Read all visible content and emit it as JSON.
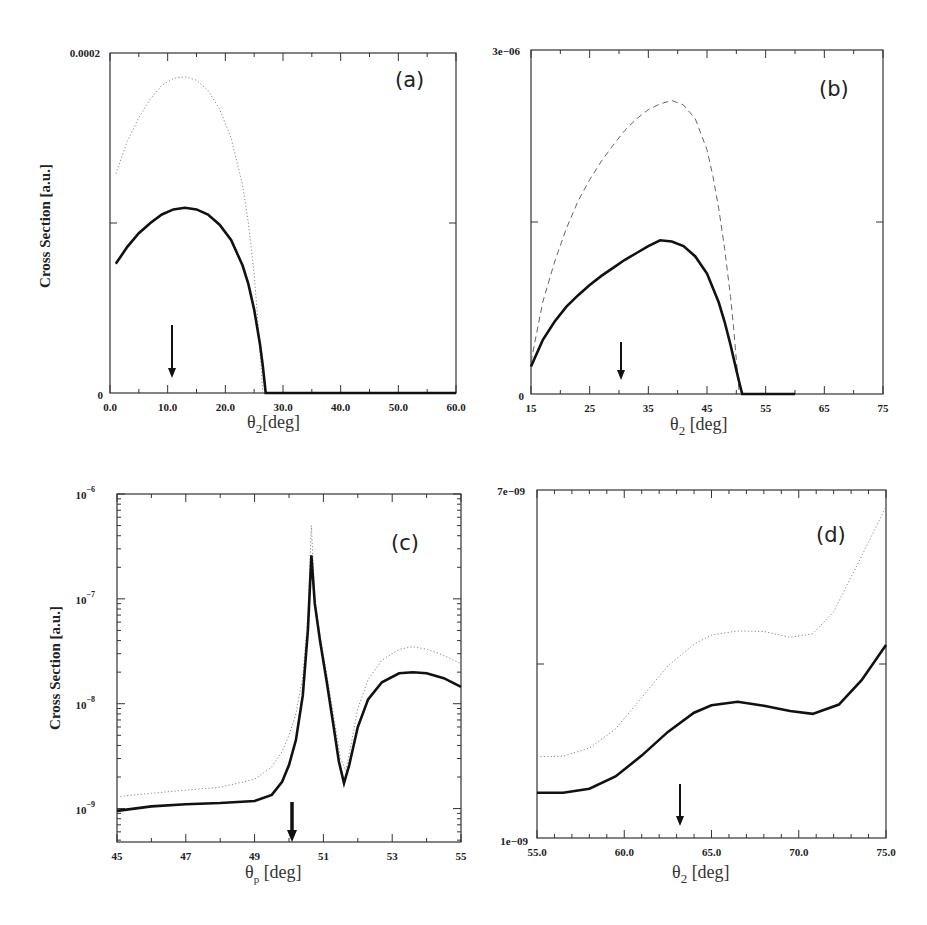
{
  "figure": {
    "shared_ylabel": "Cross Section [a.u.]"
  },
  "chart_data": [
    {
      "panel": "(a)",
      "type": "line",
      "title": "(a)",
      "xlabel": "θ2[deg]",
      "ylabel": "Cross Section [a.u.]",
      "xlim": [
        0,
        60
      ],
      "ylim": [
        0,
        0.0002
      ],
      "yscale": "linear",
      "x_ticks": [
        "0.0",
        "10.0",
        "20.0",
        "30.0",
        "40.0",
        "50.0",
        "60.0"
      ],
      "y_tick_labels": [
        "0",
        "0.0002"
      ],
      "grid": false,
      "arrow_at_x": 10.5,
      "series": [
        {
          "name": "solid",
          "style": "solid",
          "x": [
            1,
            3,
            5,
            7,
            9,
            11,
            13,
            15,
            17,
            19,
            21,
            23,
            24,
            25,
            26,
            26.5,
            27,
            30,
            40,
            50,
            60
          ],
          "y": [
            7.6e-05,
            8.6e-05,
            9.4e-05,
            0.0001,
            0.000105,
            0.000108,
            0.000109,
            0.000108,
            0.000105,
            9.9e-05,
            9e-05,
            7.5e-05,
            6.4e-05,
            4.9e-05,
            2.9e-05,
            1.6e-05,
            0,
            0,
            0,
            0,
            0
          ]
        },
        {
          "name": "dotted",
          "style": "dotted",
          "x": [
            1,
            3,
            5,
            7,
            9,
            11,
            13,
            15,
            17,
            19,
            21,
            23,
            24,
            25,
            25.8,
            26.5
          ],
          "y": [
            0.000129,
            0.000148,
            0.000162,
            0.000173,
            0.000181,
            0.000185,
            0.000186,
            0.000184,
            0.000178,
            0.000167,
            0.00015,
            0.000122,
            0.0001,
            7e-05,
            3.5e-05,
            0
          ]
        }
      ]
    },
    {
      "panel": "(b)",
      "type": "line",
      "title": "(b)",
      "xlabel": "θ2 [deg]",
      "ylabel": "",
      "xlim": [
        15,
        75
      ],
      "ylim": [
        0,
        3e-06
      ],
      "yscale": "linear",
      "x_ticks": [
        "15",
        "25",
        "35",
        "45",
        "55",
        "65",
        "75"
      ],
      "y_tick_labels": [
        "0",
        "3e−06"
      ],
      "grid": false,
      "arrow_at_x": 30,
      "series": [
        {
          "name": "solid",
          "style": "solid",
          "x": [
            15,
            17,
            19,
            21,
            23,
            25,
            27,
            29,
            31,
            33,
            35,
            37,
            39,
            41,
            43,
            45,
            47,
            48,
            49,
            50,
            50.5,
            51,
            55,
            60
          ],
          "y": [
            2.4e-07,
            4.7e-07,
            6.3e-07,
            7.6e-07,
            8.6e-07,
            9.5e-07,
            1.03e-06,
            1.1e-06,
            1.17e-06,
            1.23e-06,
            1.29e-06,
            1.34e-06,
            1.33e-06,
            1.29e-06,
            1.2e-06,
            1.05e-06,
            8e-07,
            6.3e-07,
            4.3e-07,
            2.1e-07,
            1e-07,
            0,
            0,
            0
          ]
        },
        {
          "name": "dashed",
          "style": "dashed",
          "x": [
            15,
            17,
            19,
            21,
            23,
            25,
            27,
            29,
            31,
            33,
            35,
            37,
            39,
            41,
            43,
            45,
            46,
            47,
            48,
            49,
            49.5,
            50,
            50.5
          ],
          "y": [
            2.8e-07,
            8e-07,
            1.15e-06,
            1.44e-06,
            1.68e-06,
            1.87e-06,
            2.03e-06,
            2.17e-06,
            2.3e-06,
            2.4e-06,
            2.48e-06,
            2.53e-06,
            2.56e-06,
            2.52e-06,
            2.4e-06,
            2.13e-06,
            1.9e-06,
            1.62e-06,
            1.27e-06,
            8.5e-07,
            6e-07,
            3e-07,
            0
          ]
        }
      ]
    },
    {
      "panel": "(c)",
      "type": "line",
      "title": "(c)",
      "xlabel": "θp [deg]",
      "ylabel": "Cross Section [a.u.]",
      "xlim": [
        45,
        55
      ],
      "ylim": [
        4.8e-10,
        1e-06
      ],
      "yscale": "log",
      "x_ticks": [
        "45",
        "47",
        "49",
        "51",
        "53",
        "55"
      ],
      "y_tick_labels": [
        "10^-9",
        "10^-8",
        "10^-7",
        "10^-6"
      ],
      "grid": false,
      "arrow_at_x": 50,
      "series": [
        {
          "name": "solid",
          "style": "solid",
          "x": [
            45,
            46,
            47,
            48,
            49,
            49.5,
            49.8,
            50,
            50.2,
            50.4,
            50.55,
            50.65,
            50.75,
            50.9,
            51.1,
            51.3,
            51.45,
            51.6,
            51.75,
            52,
            52.3,
            52.7,
            53.2,
            53.6,
            54,
            54.5,
            55
          ],
          "y": [
            9.5e-10,
            1.05e-09,
            1.1e-09,
            1.13e-09,
            1.18e-09,
            1.35e-09,
            1.8e-09,
            2.6e-09,
            4.5e-09,
            1.2e-08,
            5e-08,
            2.6e-07,
            9e-08,
            4e-08,
            1.6e-08,
            6e-09,
            2.8e-09,
            1.75e-09,
            2.6e-09,
            6e-09,
            1.1e-08,
            1.6e-08,
            1.95e-08,
            2e-08,
            1.95e-08,
            1.75e-08,
            1.45e-08
          ]
        },
        {
          "name": "dotted",
          "style": "dotted",
          "x": [
            45,
            46,
            47,
            48,
            49,
            49.5,
            49.8,
            50,
            50.2,
            50.4,
            50.55,
            50.65,
            50.75,
            50.9,
            51.1,
            51.3,
            51.5,
            51.65,
            51.8,
            52,
            52.3,
            52.7,
            53.2,
            53.6,
            54,
            54.5,
            55
          ],
          "y": [
            1.3e-09,
            1.4e-09,
            1.5e-09,
            1.6e-09,
            1.9e-09,
            2.5e-09,
            3.5e-09,
            5e-09,
            8e-09,
            1.8e-08,
            7e-08,
            5e-07,
            1e-07,
            4.5e-08,
            1.9e-08,
            7.5e-09,
            3e-09,
            2.3e-09,
            4e-09,
            9e-09,
            1.7e-08,
            2.6e-08,
            3.3e-08,
            3.5e-08,
            3.3e-08,
            2.9e-08,
            2.4e-08
          ]
        }
      ]
    },
    {
      "panel": "(d)",
      "type": "line",
      "title": "(d)",
      "xlabel": "θ2 [deg]",
      "ylabel": "",
      "xlim": [
        55,
        75
      ],
      "ylim": [
        1e-09,
        7e-09
      ],
      "yscale": "linear",
      "x_ticks": [
        "55.0",
        "60.0",
        "65.0",
        "70.0",
        "75.0"
      ],
      "y_tick_labels": [
        "1e−09",
        "7e−09"
      ],
      "grid": false,
      "arrow_at_x": 63.2,
      "series": [
        {
          "name": "solid",
          "style": "solid",
          "x": [
            55,
            56.5,
            58,
            59.5,
            61,
            62.5,
            64,
            65,
            66.5,
            68,
            69.5,
            70.8,
            72.3,
            73.6,
            75
          ],
          "y": [
            1.78e-09,
            1.78e-09,
            1.85e-09,
            2.06e-09,
            2.42e-09,
            2.83e-09,
            3.16e-09,
            3.29e-09,
            3.35e-09,
            3.28e-09,
            3.19e-09,
            3.14e-09,
            3.3e-09,
            3.72e-09,
            4.33e-09
          ]
        },
        {
          "name": "dotted",
          "style": "dotted",
          "x": [
            55,
            56.5,
            58,
            59.5,
            61,
            62.5,
            64,
            65,
            66.5,
            68,
            69.5,
            70.8,
            72,
            73,
            74,
            75
          ],
          "y": [
            2.4e-09,
            2.41e-09,
            2.55e-09,
            2.88e-09,
            3.42e-09,
            3.97e-09,
            4.34e-09,
            4.5e-09,
            4.57e-09,
            4.56e-09,
            4.46e-09,
            4.52e-09,
            4.9e-09,
            5.5e-09,
            6.1e-09,
            6.71e-09
          ]
        }
      ]
    }
  ],
  "panels": [
    {
      "tag": "(a)",
      "xlabel_main": "θ",
      "xlabel_sub": "2",
      "xlabel_rest": "[deg]",
      "ylabel": "Cross Section [a.u.]",
      "ytop": "0.0002",
      "ybottom": "0",
      "xticks": [
        "0.0",
        "10.0",
        "20.0",
        "30.0",
        "40.0",
        "50.0",
        "60.0"
      ]
    },
    {
      "tag": "(b)",
      "xlabel_main": "θ",
      "xlabel_sub": "2",
      "xlabel_rest": " [deg]",
      "ytop": "3e−06",
      "ybottom": "0",
      "xticks": [
        "15",
        "25",
        "35",
        "45",
        "55",
        "65",
        "75"
      ]
    },
    {
      "tag": "(c)",
      "xlabel_main": "θ",
      "xlabel_sub": "p",
      "xlabel_rest": " [deg]",
      "ylabel": "Cross Section [a.u.]",
      "ydecades": [
        "10",
        "10",
        "10",
        "10"
      ],
      "yexps": [
        "−9",
        "−8",
        "−7",
        "−6"
      ],
      "xticks": [
        "45",
        "47",
        "49",
        "51",
        "53",
        "55"
      ]
    },
    {
      "tag": "(d)",
      "xlabel_main": "θ",
      "xlabel_sub": "2",
      "xlabel_rest": " [deg]",
      "ytop": "7e−09",
      "ybottom": "1e−09",
      "xticks": [
        "55.0",
        "60.0",
        "65.0",
        "70.0",
        "75.0"
      ]
    }
  ]
}
